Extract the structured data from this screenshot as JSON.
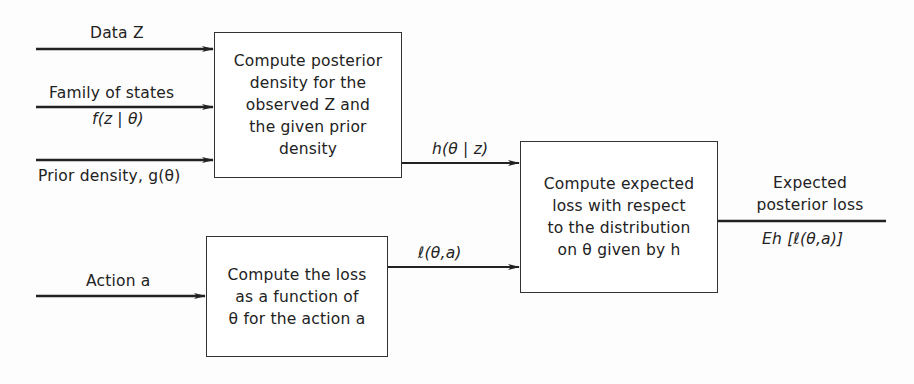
{
  "diagram": {
    "inputs": {
      "data": "Data Z",
      "family": "Family of states",
      "family_formula": "f(z | θ)",
      "prior": "Prior density, g(θ)",
      "action": "Action a"
    },
    "boxes": {
      "posterior": "Compute posterior\ndensity for the\nobserved Z and\nthe given prior\ndensity",
      "loss": "Compute the loss\nas a function of\nθ for the action a",
      "expected": "Compute expected\nloss with respect\nto the distribution\non θ given by h"
    },
    "edges": {
      "posterior_out": "h(θ | z)",
      "loss_out": "ℓ(θ,a)"
    },
    "output": {
      "label": "Expected\nposterior loss",
      "formula": "Eh [ℓ(θ,a)]"
    },
    "colors": {
      "line": "#222222",
      "box_border": "#333333"
    }
  }
}
